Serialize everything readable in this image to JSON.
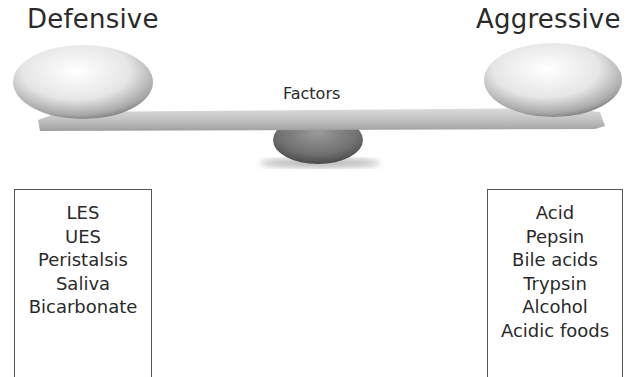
{
  "diagram": {
    "left_heading": "Defensive",
    "right_heading": "Aggressive",
    "center_label": "Factors",
    "defensive_factors": [
      "LES",
      "UES",
      "Peristalsis",
      "Saliva",
      "Bicarbonate"
    ],
    "aggressive_factors": [
      "Acid",
      "Pepsin",
      "Bile acids",
      "Trypsin",
      "Alcohol",
      "Acidic foods"
    ]
  }
}
